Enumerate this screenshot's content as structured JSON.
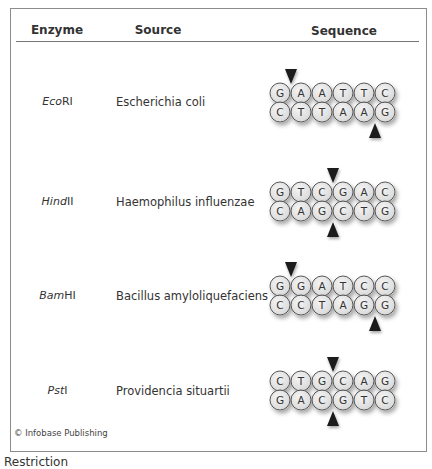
{
  "table": {
    "headers": {
      "enzyme": "Enzyme",
      "source": "Source",
      "sequence": "Sequence"
    },
    "rows": [
      {
        "enzyme_italic": "Eco",
        "enzyme_suffix": "RI",
        "source": "Escherichia coli",
        "top_strand": [
          "G",
          "A",
          "A",
          "T",
          "T",
          "C"
        ],
        "bottom_strand": [
          "C",
          "T",
          "T",
          "A",
          "A",
          "G"
        ],
        "top_cut_after": 0,
        "bottom_cut_after": 4
      },
      {
        "enzyme_italic": "Hind",
        "enzyme_suffix": "II",
        "source": "Haemophilus influenzae",
        "top_strand": [
          "G",
          "T",
          "C",
          "G",
          "A",
          "C"
        ],
        "bottom_strand": [
          "C",
          "A",
          "G",
          "C",
          "T",
          "G"
        ],
        "top_cut_after": 2,
        "bottom_cut_after": 2
      },
      {
        "enzyme_italic": "Bam",
        "enzyme_suffix": "HI",
        "source": "Bacillus amyloliquefaciens",
        "top_strand": [
          "G",
          "G",
          "A",
          "T",
          "C",
          "C"
        ],
        "bottom_strand": [
          "C",
          "C",
          "T",
          "A",
          "G",
          "G"
        ],
        "top_cut_after": 0,
        "bottom_cut_after": 4
      },
      {
        "enzyme_italic": "Pst",
        "enzyme_suffix": "I",
        "source": "Providencia situartii",
        "top_strand": [
          "C",
          "T",
          "G",
          "C",
          "A",
          "G"
        ],
        "bottom_strand": [
          "G",
          "A",
          "C",
          "G",
          "T",
          "C"
        ],
        "top_cut_after": 2,
        "bottom_cut_after": 2
      }
    ]
  },
  "copyright": "© Infobase Publishing",
  "caption_partial": "Restriction",
  "colors": {
    "circle_fill": "#dcdcdc",
    "circle_border": "#555555",
    "arrow": "#1c1c1c",
    "frame_border": "#8c8c8c"
  }
}
